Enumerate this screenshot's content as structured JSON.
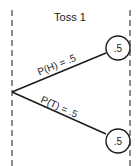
{
  "diagram": {
    "title": "Toss 1",
    "branches": [
      {
        "label": "P(H) = .5",
        "outcome": ".5"
      },
      {
        "label": "P(T) = .5",
        "outcome": ".5"
      }
    ],
    "colors": {
      "stroke": "#1a1a1a",
      "background": "#ffffff"
    }
  }
}
